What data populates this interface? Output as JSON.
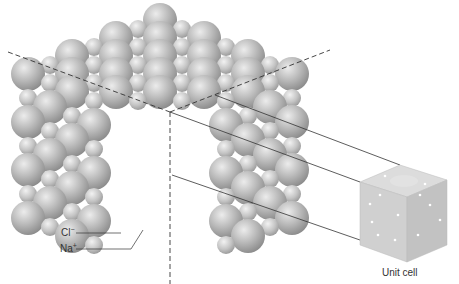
{
  "labels": {
    "cl_base": "Cl",
    "cl_sup": "−",
    "na_base": "Na",
    "na_sup": "+",
    "unit_cell": "Unit cell"
  },
  "colors": {
    "background": "#ffffff",
    "sphere_light": "#e6e6e6",
    "sphere_mid": "#b4b4b4",
    "sphere_dark": "#8a8a8a",
    "line": "#333333",
    "cube_top": "#d9d9d9",
    "cube_left": "#cfcfcf",
    "cube_right": "#c4c4c4"
  }
}
